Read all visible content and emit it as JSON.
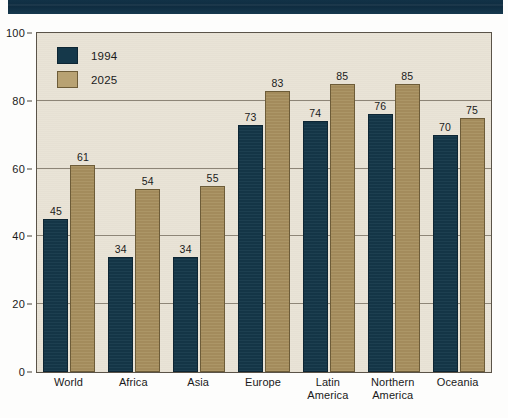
{
  "banner": {
    "name": "top-banner",
    "color": "#123247"
  },
  "legend": {
    "position": "top-left-inside-plot",
    "entries": [
      {
        "label": "1994",
        "color": "#15384a"
      },
      {
        "label": "2025",
        "color": "#a8905f"
      }
    ]
  },
  "chart_data": {
    "type": "bar",
    "title": "",
    "subtitle": "",
    "xlabel": "",
    "ylabel": "",
    "ylim": [
      0,
      100
    ],
    "yticks": [
      0,
      20,
      40,
      60,
      80,
      100
    ],
    "ytick_labels": [
      "0",
      "20",
      "40",
      "60",
      "80",
      "100"
    ],
    "grid": true,
    "grid_axis": "y",
    "legend_position": "upper left",
    "categories": [
      "World",
      "Africa",
      "Asia",
      "Europe",
      "Latin\nAmerica",
      "Northern\nAmerica",
      "Oceania"
    ],
    "series": [
      {
        "name": "1994",
        "color": "#15384a",
        "values": [
          45,
          34,
          34,
          73,
          74,
          76,
          70
        ]
      },
      {
        "name": "2025",
        "color": "#a8905f",
        "values": [
          61,
          54,
          55,
          83,
          85,
          85,
          75
        ]
      }
    ],
    "annotations": {
      "bar_value_labels": true
    }
  },
  "colors": {
    "plot_background": "#e9e3d6",
    "plot_border": "#5a5348",
    "gridline": "#8d8577",
    "series_1994": "#15384a",
    "series_2025": "#a8905f",
    "text": "#1a1a1a",
    "banner": "#123247"
  }
}
